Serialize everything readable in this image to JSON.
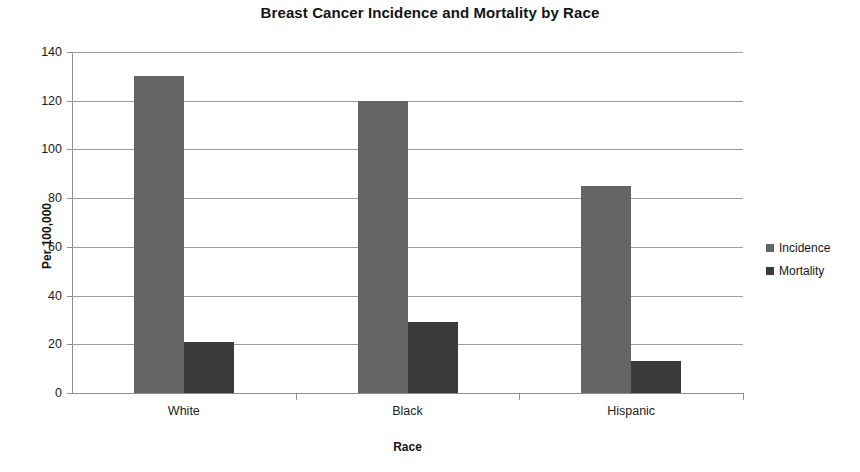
{
  "chart_data": {
    "type": "bar",
    "title": "Breast Cancer Incidence and Mortality by Race",
    "xlabel": "Race",
    "ylabel": "Per 100,000",
    "categories": [
      "White",
      "Black",
      "Hispanic"
    ],
    "series": [
      {
        "name": "Incidence",
        "values": [
          130,
          120,
          85
        ],
        "color": "#656565"
      },
      {
        "name": "Mortality",
        "values": [
          21,
          29,
          13
        ],
        "color": "#3a3a3a"
      }
    ],
    "ylim": [
      0,
      140
    ],
    "yticks": [
      0,
      20,
      40,
      60,
      80,
      100,
      120,
      140
    ],
    "ytick_labels": [
      "0",
      "20",
      "40",
      "60",
      "80",
      "100",
      "120",
      "140"
    ],
    "grid": true,
    "legend_position": "right",
    "legend_entries": [
      "Incidence",
      "Mortality"
    ]
  }
}
